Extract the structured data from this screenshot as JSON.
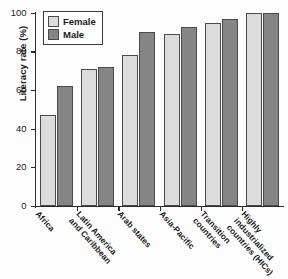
{
  "chart_data": {
    "type": "bar",
    "title": "",
    "xlabel": "",
    "ylabel": "Literacy rate (%)",
    "ylim": [
      0,
      100
    ],
    "yticks": [
      0,
      20,
      40,
      60,
      80,
      100
    ],
    "ytick_labels": [
      "0",
      "20",
      "40",
      "60",
      "80",
      "100"
    ],
    "grid": false,
    "legend_position": "top-left",
    "categories": [
      "Africa",
      "Latin America and Caribbean",
      "Arab states",
      "Asia-Pacific",
      "Transition countries",
      "Highly industrialized countries (HICs)"
    ],
    "category_lines": [
      [
        "Africa"
      ],
      [
        "Latin America",
        "and Caribbean"
      ],
      [
        "Arab states"
      ],
      [
        "Asia-Pacific"
      ],
      [
        "Transition",
        "countries"
      ],
      [
        "Highly",
        "industrialized",
        "countries (HICs)"
      ]
    ],
    "series": [
      {
        "name": "Female",
        "color": "#dcdcdc",
        "values": [
          47,
          71,
          78,
          89,
          95,
          100
        ]
      },
      {
        "name": "Male",
        "color": "#858585",
        "values": [
          62,
          72,
          90,
          93,
          97,
          100
        ]
      }
    ]
  },
  "legend": {
    "items": [
      {
        "label": "Female",
        "swatch": "female"
      },
      {
        "label": "Male",
        "swatch": "male"
      }
    ]
  }
}
